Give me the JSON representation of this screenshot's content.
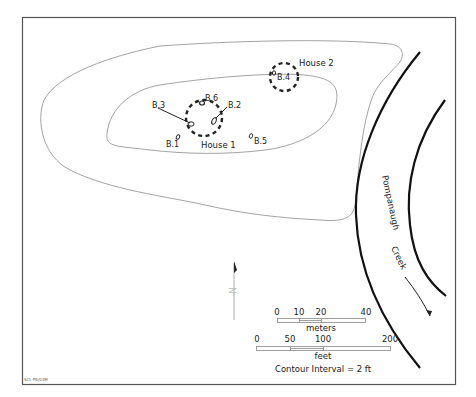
{
  "map": {
    "houses": [
      {
        "label": "House 1",
        "cx": 204,
        "cy": 118,
        "r": 18
      },
      {
        "label": "House 2",
        "cx": 284,
        "cy": 77,
        "r": 14
      }
    ],
    "boreholes": [
      {
        "label": "B.1"
      },
      {
        "label": "B.2"
      },
      {
        "label": "B.3"
      },
      {
        "label": "B.4"
      },
      {
        "label": "B.5"
      },
      {
        "label": "B.6"
      }
    ],
    "creek": {
      "name_part1": "Pompanaugh",
      "name_part2": "Creek"
    },
    "north_arrow": {
      "label": "N"
    },
    "scale_meters": {
      "ticks": [
        "0",
        "10",
        "20",
        "40"
      ],
      "unit": "meters"
    },
    "scale_feet": {
      "ticks": [
        "0",
        "50",
        "100",
        "200"
      ],
      "unit": "feet"
    },
    "contour_note": "Contour Interval = 2 ft",
    "credit": "SCL-P8/03M",
    "colors": {
      "frame": "#555555",
      "contour": "#999999",
      "creek_bank": "#111111",
      "marker": "#222222"
    }
  }
}
